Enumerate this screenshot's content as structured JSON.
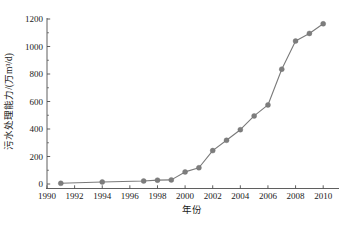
{
  "chart_data": {
    "type": "line",
    "title": "",
    "xlabel": "年份",
    "ylabel": "污水处理能力/(万m³/d)",
    "xlim": [
      1990,
      2011
    ],
    "ylim": [
      0,
      1200
    ],
    "grid": false,
    "legend": null,
    "xticks": [
      1990,
      1992,
      1994,
      1996,
      1998,
      2000,
      2002,
      2004,
      2006,
      2008,
      2010
    ],
    "xtick_labels": [
      "1990",
      "1992",
      "1994",
      "1996",
      "1998",
      "2000",
      "2002",
      "2004",
      "2006",
      "2008",
      "2010"
    ],
    "yticks": [
      0,
      200,
      400,
      600,
      800,
      1000,
      1200
    ],
    "ytick_labels": [
      "0",
      "200",
      "400",
      "600",
      "800",
      "1000",
      "1200"
    ],
    "yminor_ticks": [
      100,
      300,
      500,
      700,
      900,
      1100
    ],
    "marker": "filled-circle",
    "marker_color": "#7d7d7d",
    "line_color": "#7a7a7a",
    "x": [
      1991,
      1994,
      1997,
      1998,
      1999,
      2000,
      2001,
      2002,
      2003,
      2004,
      2005,
      2006,
      2007,
      2008,
      2009,
      2010
    ],
    "values": [
      5,
      15,
      22,
      28,
      30,
      88,
      118,
      243,
      318,
      395,
      495,
      575,
      835,
      1040,
      1095,
      1165
    ],
    "series": [
      {
        "name": "污水处理能力",
        "x": [
          1991,
          1994,
          1997,
          1998,
          1999,
          2000,
          2001,
          2002,
          2003,
          2004,
          2005,
          2006,
          2007,
          2008,
          2009,
          2010
        ],
        "values": [
          5,
          15,
          22,
          28,
          30,
          88,
          118,
          243,
          318,
          395,
          495,
          575,
          835,
          1040,
          1095,
          1165
        ]
      }
    ]
  },
  "figure": {
    "background": "#ffffff",
    "axis_color": "#4d4d4d"
  }
}
